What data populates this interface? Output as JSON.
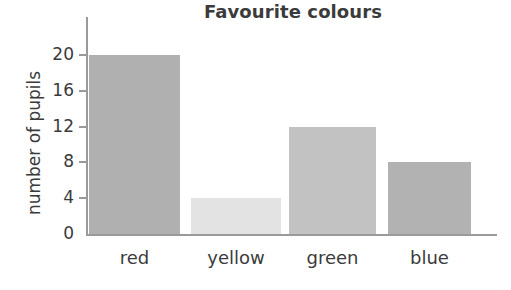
{
  "chart_data": {
    "type": "bar",
    "title": "Favourite colours",
    "xlabel": "",
    "ylabel": "number of pupils",
    "categories": [
      "red",
      "yellow",
      "green",
      "blue"
    ],
    "values": [
      20,
      4,
      12,
      8
    ],
    "series": [
      {
        "name": "number of pupils",
        "values": [
          20,
          4,
          12,
          8
        ]
      }
    ],
    "yticks": [
      0,
      4,
      8,
      12,
      16,
      20
    ],
    "ytick_labels": [
      "0",
      "4",
      "8",
      "12",
      "16",
      "20"
    ],
    "ylim": [
      0,
      22
    ],
    "grid": false,
    "legend": false,
    "bar_colors": [
      "#b0b0b0",
      "#e3e3e3",
      "#c2c2c2",
      "#b2b2b2"
    ],
    "axis_color": "#9a9a9a",
    "text_color": "#3b3b3b",
    "background": "#ffffff"
  }
}
